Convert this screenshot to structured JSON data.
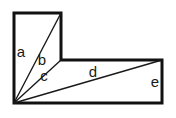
{
  "figure": {
    "type": "geometry-diagram",
    "background_color": "#ffffff",
    "outline_color": "#111111",
    "outline_width": 3,
    "diagonal_color": "#1a1a1a",
    "diagonal_width": 1.4,
    "label_color": "#1a1a1a",
    "canvas": {
      "width": 176,
      "height": 118
    },
    "vertices": {
      "top_left": {
        "x": 14,
        "y": 13,
        "name": "A"
      },
      "top_right_tall": {
        "x": 61,
        "y": 13,
        "name": "B"
      },
      "step_inner": {
        "x": 61,
        "y": 60,
        "name": "C"
      },
      "top_right_far": {
        "x": 162,
        "y": 60,
        "name": "D"
      },
      "bottom_right": {
        "x": 162,
        "y": 103,
        "name": "E"
      },
      "bottom_left": {
        "x": 14,
        "y": 103,
        "name": "F"
      }
    },
    "outline_path": "M 14 13 L 61 13 L 61 60 L 162 60 L 162 103 L 14 103 Z",
    "diagonals": [
      {
        "id": "b",
        "from": "bottom_left",
        "to": "top_right_tall",
        "x1": 14,
        "y1": 103,
        "x2": 61,
        "y2": 13
      },
      {
        "id": "c",
        "from": "bottom_left",
        "to": "step_inner",
        "x1": 14,
        "y1": 103,
        "x2": 61,
        "y2": 60
      },
      {
        "id": "d",
        "from": "bottom_left",
        "to": "top_right_far",
        "x1": 14,
        "y1": 103,
        "x2": 162,
        "y2": 60
      }
    ],
    "labels": [
      {
        "id": "a",
        "text": "a",
        "x": 21,
        "y": 53,
        "describes": "left vertical side"
      },
      {
        "id": "b",
        "text": "b",
        "x": 42,
        "y": 61,
        "describes": "diagonal to upper-right corner"
      },
      {
        "id": "c",
        "text": "c",
        "x": 44,
        "y": 77,
        "describes": "diagonal to inner step corner"
      },
      {
        "id": "d",
        "text": "d",
        "x": 93,
        "y": 73,
        "describes": "long diagonal to far upper-right corner"
      },
      {
        "id": "e",
        "text": "e",
        "x": 155,
        "y": 83,
        "describes": "right vertical side"
      }
    ]
  }
}
